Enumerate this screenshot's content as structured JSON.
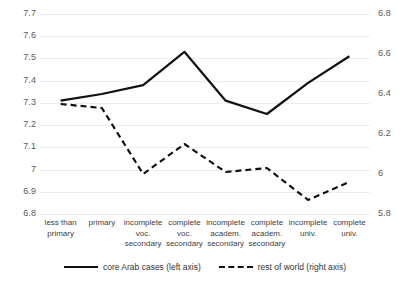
{
  "chart_data": {
    "type": "line",
    "title": "",
    "xlabel": "",
    "categories": [
      "less than primary",
      "primary",
      "incomplete voc. secondary",
      "complete voc. secondary",
      "incomplete academ. secondary",
      "complete academ. secondary",
      "incomplete univ.",
      "complete univ."
    ],
    "series": [
      {
        "name": "core Arab cases (left axis)",
        "axis": "left",
        "style": "solid",
        "color": "#111111",
        "values": [
          7.31,
          7.34,
          7.38,
          7.53,
          7.31,
          7.25,
          7.39,
          7.51
        ]
      },
      {
        "name": "rest of world (right axis)",
        "axis": "right",
        "style": "dashed",
        "color": "#111111",
        "values": [
          6.35,
          6.33,
          6.0,
          6.15,
          6.01,
          6.03,
          5.87,
          5.96
        ]
      }
    ],
    "left_axis": {
      "ylim": [
        6.8,
        7.7
      ],
      "ticks": [
        "6.8",
        "6.9",
        "7",
        "7.1",
        "7.2",
        "7.3",
        "7.4",
        "7.5",
        "7.6",
        "7.7"
      ],
      "label": "left axis"
    },
    "right_axis": {
      "ylim": [
        5.8,
        6.8
      ],
      "ticks": [
        "5.8",
        "6",
        "6.2",
        "6.4",
        "6.6",
        "6.8"
      ],
      "label": "right axis"
    },
    "grid": true,
    "legend_position": "bottom"
  },
  "legend": {
    "items": [
      {
        "label": "core Arab cases (left axis)",
        "style": "solid"
      },
      {
        "label": "rest of world (right axis)",
        "style": "dashed"
      }
    ]
  }
}
